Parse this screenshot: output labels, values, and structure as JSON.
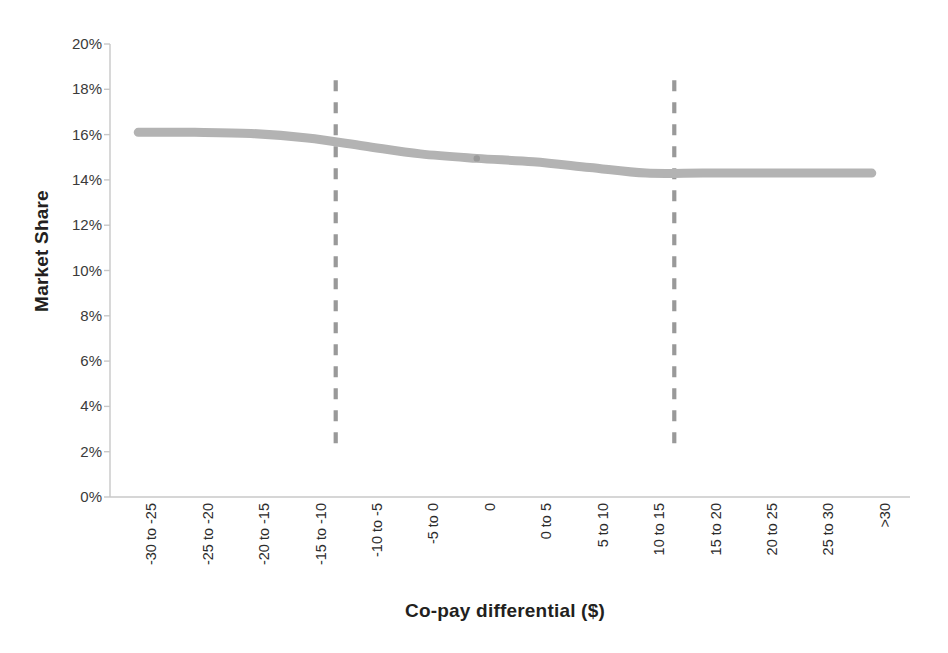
{
  "chart_data": {
    "type": "line",
    "title": "",
    "subtitle": "",
    "xlabel": "Co-pay differential ($)",
    "ylabel": "Market Share",
    "grid": false,
    "legend": "none",
    "categories": [
      "-30 to -25",
      "-25 to -20",
      "-20 to -15",
      "-15 to -10",
      "-10 to -5",
      "-5 to 0",
      "0",
      "0 to 5",
      "5 to 10",
      "10 to 15",
      "15 to 20",
      "20 to 25",
      "25 to 30",
      ">30"
    ],
    "series": [
      {
        "name": "Market Share",
        "values": [
          16.1,
          16.1,
          16.05,
          15.85,
          15.5,
          15.15,
          14.95,
          14.8,
          14.55,
          14.3,
          14.3,
          14.3,
          14.3,
          14.3
        ],
        "color": "#b3b3b3",
        "line_width_px": 9
      }
    ],
    "ylim": [
      0,
      20
    ],
    "y_tick_values": [
      0,
      2,
      4,
      6,
      8,
      10,
      12,
      14,
      16,
      18,
      20
    ],
    "y_tick_labels": [
      "0%",
      "2%",
      "4%",
      "6%",
      "8%",
      "10%",
      "12%",
      "14%",
      "16%",
      "18%",
      "20%"
    ],
    "y_tick_format": "percent",
    "annotations": [
      {
        "type": "vertical-dashed-line",
        "name": "left-threshold-line",
        "at_category": "-15 to -10",
        "x_value": -11.0,
        "y_from": 2.1,
        "y_to": 18.4,
        "color": "#999999"
      },
      {
        "type": "vertical-dashed-line",
        "name": "right-threshold-line",
        "at_category": "10 to 15",
        "x_value": 10.5,
        "y_from": 2.1,
        "y_to": 18.4,
        "color": "#999999"
      }
    ],
    "axis_color": "#c8c8c8",
    "background_color": "#ffffff"
  },
  "axes": {
    "y_title": "Market Share",
    "x_title": "Co-pay differential ($)"
  }
}
